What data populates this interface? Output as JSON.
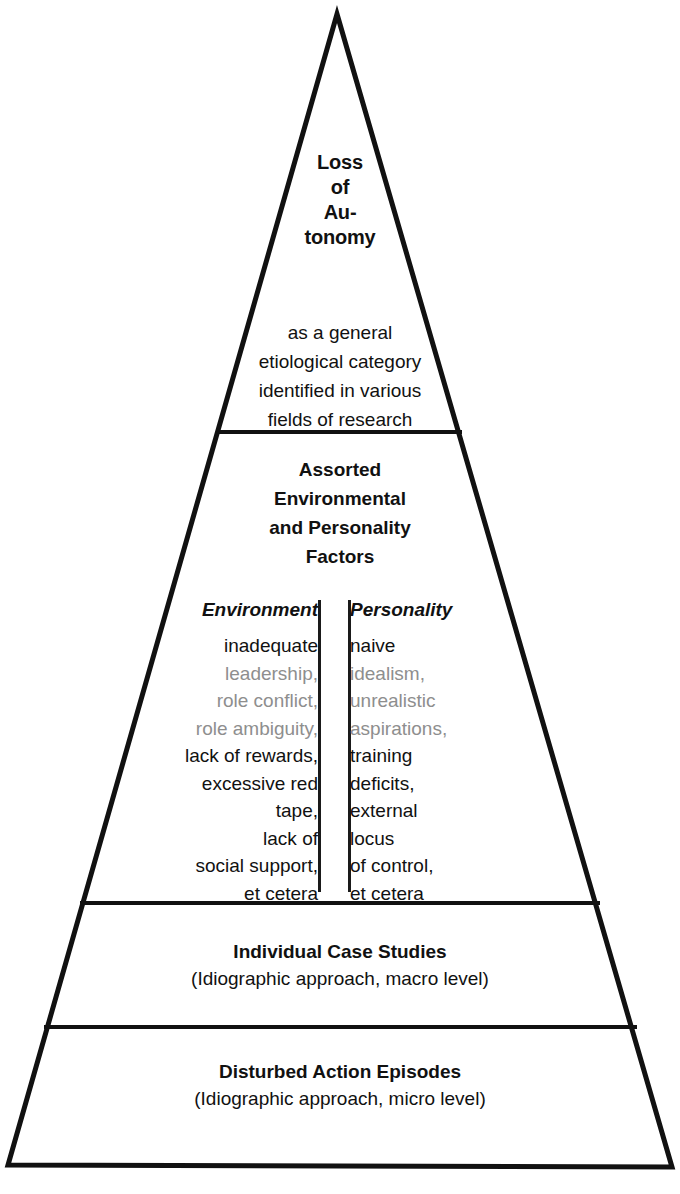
{
  "diagram": {
    "type": "pyramid",
    "orientation": "apex-up",
    "tier_count": 5,
    "stroke_color": "#111111",
    "fill_color": "#ffffff",
    "faded_text_color": "#8e8e8e"
  },
  "tiers": {
    "apex": {
      "lines": [
        "Loss",
        "of",
        "Au-",
        "tonomy"
      ],
      "style": "bold"
    },
    "general": {
      "lines": [
        "as a general",
        "etiological category",
        "identified in various",
        "fields of research"
      ],
      "style": "regular"
    },
    "assorted": {
      "lines": [
        "Assorted",
        "Environmental",
        "and Personality",
        "Factors"
      ],
      "style": "bold"
    },
    "factors": {
      "columns": [
        {
          "heading": "Environment",
          "align": "right",
          "items": [
            {
              "text": "inadequate",
              "faded": false
            },
            {
              "text": "leadership,",
              "faded": true
            },
            {
              "text": "role conflict,",
              "faded": true
            },
            {
              "text": "role ambiguity,",
              "faded": true
            },
            {
              "text": "lack of rewards,",
              "faded": false
            },
            {
              "text": "excessive red",
              "faded": false
            },
            {
              "text": "tape,",
              "faded": false
            },
            {
              "text": "lack of",
              "faded": false
            },
            {
              "text": "social support,",
              "faded": false
            },
            {
              "text": "et cetera",
              "faded": false
            }
          ]
        },
        {
          "heading": "Personality",
          "align": "left",
          "items": [
            {
              "text": "naive",
              "faded": false
            },
            {
              "text": "idealism,",
              "faded": true
            },
            {
              "text": "unrealistic",
              "faded": true
            },
            {
              "text": "aspirations,",
              "faded": true
            },
            {
              "text": "training",
              "faded": false
            },
            {
              "text": "deficits,",
              "faded": false
            },
            {
              "text": "external",
              "faded": false
            },
            {
              "text": "locus",
              "faded": false
            },
            {
              "text": "of control,",
              "faded": false
            },
            {
              "text": "et cetera",
              "faded": false
            }
          ]
        }
      ]
    },
    "cases": {
      "title": "Individual Case Studies",
      "subtitle": "(Idiographic approach, macro level)"
    },
    "episodes": {
      "title": "Disturbed Action Episodes",
      "subtitle": "(Idiographic approach, micro level)"
    }
  }
}
